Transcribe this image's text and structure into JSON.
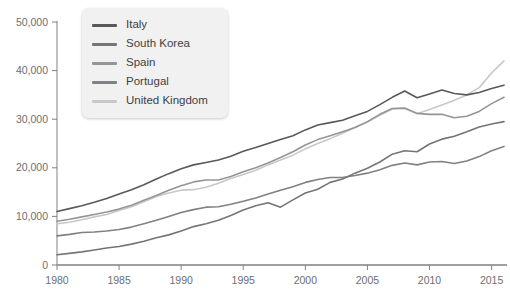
{
  "chart_data": {
    "type": "line",
    "title": "",
    "subtitle": "",
    "xlabel": "",
    "ylabel": "",
    "xlim": [
      1980,
      2016
    ],
    "ylim": [
      0,
      50000
    ],
    "grid": false,
    "legend_position": "top-left",
    "x": [
      1980,
      1981,
      1982,
      1983,
      1984,
      1985,
      1986,
      1987,
      1988,
      1989,
      1990,
      1991,
      1992,
      1993,
      1994,
      1995,
      1996,
      1997,
      1998,
      1999,
      2000,
      2001,
      2002,
      2003,
      2004,
      2005,
      2006,
      2007,
      2008,
      2009,
      2010,
      2011,
      2012,
      2013,
      2014,
      2015,
      2016
    ],
    "x_ticks": [
      1980,
      1985,
      1990,
      1995,
      2000,
      2005,
      2010,
      2015
    ],
    "x_tick_labels": [
      "1980",
      "1985",
      "1990",
      "1995",
      "2000",
      "2005",
      "2010",
      "2015"
    ],
    "y_ticks": [
      0,
      10000,
      20000,
      30000,
      40000,
      50000
    ],
    "y_tick_labels": [
      "0",
      "10,000",
      "20,000",
      "30,000",
      "40,000",
      "50,000"
    ],
    "series": [
      {
        "name": "Italy",
        "color": "#58595b",
        "values": [
          11000,
          11600,
          12200,
          12900,
          13700,
          14600,
          15500,
          16500,
          17700,
          18800,
          19800,
          20600,
          21100,
          21600,
          22400,
          23400,
          24200,
          25000,
          25800,
          26600,
          27800,
          28800,
          29300,
          29800,
          30700,
          31600,
          33000,
          34500,
          35800,
          34400,
          35200,
          36000,
          35300,
          35000,
          35500,
          36300,
          37000
        ]
      },
      {
        "name": "South Korea",
        "color": "#747577",
        "values": [
          2100,
          2400,
          2700,
          3100,
          3500,
          3800,
          4300,
          4900,
          5600,
          6200,
          7000,
          7900,
          8500,
          9200,
          10200,
          11300,
          12200,
          12800,
          11900,
          13400,
          14800,
          15600,
          17000,
          17700,
          18900,
          19900,
          21200,
          22800,
          23500,
          23300,
          24900,
          25900,
          26500,
          27400,
          28400,
          29000,
          29500
        ]
      },
      {
        "name": "Spain",
        "color": "#939598",
        "values": [
          9000,
          9400,
          9900,
          10400,
          10900,
          11500,
          12300,
          13300,
          14300,
          15400,
          16300,
          17100,
          17500,
          17500,
          18200,
          19200,
          20000,
          21000,
          22100,
          23300,
          24700,
          25800,
          26600,
          27400,
          28300,
          29500,
          31000,
          32200,
          32300,
          31200,
          31000,
          31000,
          30300,
          30600,
          31600,
          33200,
          34500
        ]
      },
      {
        "name": "Portugal",
        "color": "#808184"
      },
      {
        "name": "United Kingdom",
        "color": "#c7c8ca",
        "values": [
          8500,
          8800,
          9300,
          9900,
          10400,
          11200,
          12000,
          13000,
          14100,
          14800,
          15400,
          15500,
          16000,
          16800,
          17800,
          18600,
          19500,
          20600,
          21600,
          22600,
          23900,
          25000,
          26000,
          27100,
          28300,
          29400,
          30800,
          32100,
          32200,
          31100,
          32000,
          32900,
          33900,
          35000,
          36500,
          39500,
          42000
        ]
      }
    ],
    "series_portugal_values": [
      6000,
      6300,
      6700,
      6800,
      7000,
      7300,
      7800,
      8500,
      9200,
      10000,
      10800,
      11400,
      11900,
      12000,
      12500,
      13100,
      13800,
      14600,
      15400,
      16100,
      17000,
      17600,
      18000,
      18000,
      18400,
      18900,
      19600,
      20500,
      21000,
      20600,
      21200,
      21300,
      20900,
      21400,
      22300,
      23500,
      24400
    ]
  },
  "legend": {
    "items": [
      {
        "label": "Italy",
        "color": "#58595b"
      },
      {
        "label": "South Korea",
        "color": "#747577"
      },
      {
        "label": "Spain",
        "color": "#939598"
      },
      {
        "label": "Portugal",
        "color": "#808184"
      },
      {
        "label": "United Kingdom",
        "color": "#c7c8ca"
      }
    ]
  },
  "axes": {
    "axis_color": "#808184",
    "label_color": "#6d6e70"
  }
}
